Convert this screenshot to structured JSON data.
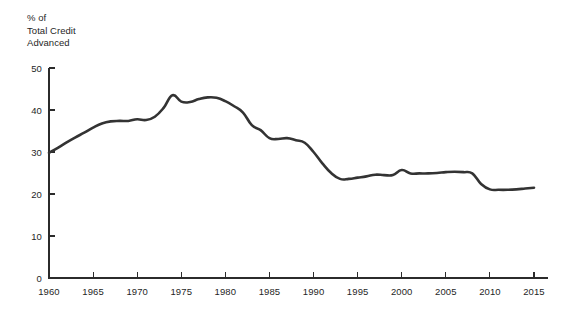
{
  "chart_data": {
    "type": "line",
    "title": "",
    "subtitle": "",
    "ylabel_lines": [
      "% of",
      "Total Credit",
      "Advanced"
    ],
    "ylabel": "% of Total Credit Advanced",
    "xlabel": "",
    "xlim": [
      1960,
      2015
    ],
    "ylim": [
      0,
      50
    ],
    "grid": false,
    "legend": false,
    "legend_position": "none",
    "line_color": "#333333",
    "axis_color": "#2b2b2b",
    "background_color": "#ffffff",
    "yticks": [
      0,
      10,
      20,
      30,
      40,
      50
    ],
    "ytick_labels": [
      "0",
      "10",
      "20",
      "30",
      "40",
      "50"
    ],
    "xticks": [
      1960,
      1965,
      1970,
      1975,
      1980,
      1985,
      1990,
      1995,
      2000,
      2005,
      2010,
      2015
    ],
    "xtick_labels": [
      "1960",
      "1965",
      "1970",
      "1975",
      "1980",
      "1985",
      "1990",
      "1995",
      "2000",
      "2005",
      "2010",
      "2015"
    ],
    "series": [
      {
        "name": "Share of total credit advanced",
        "color": "#333333",
        "x": [
          1960,
          1961,
          1962,
          1963,
          1964,
          1965,
          1966,
          1967,
          1968,
          1969,
          1970,
          1971,
          1972,
          1973,
          1974,
          1975,
          1976,
          1977,
          1978,
          1979,
          1980,
          1981,
          1982,
          1983,
          1984,
          1985,
          1986,
          1987,
          1988,
          1989,
          1990,
          1991,
          1992,
          1993,
          1994,
          1995,
          1996,
          1997,
          1998,
          1999,
          2000,
          2001,
          2002,
          2003,
          2004,
          2005,
          2006,
          2007,
          2008,
          2009,
          2010,
          2011,
          2012,
          2013,
          2014,
          2015
        ],
        "values": [
          29.8,
          31.0,
          32.3,
          33.5,
          34.6,
          35.8,
          36.8,
          37.3,
          37.4,
          37.4,
          37.8,
          37.6,
          38.4,
          40.5,
          43.5,
          42.0,
          41.9,
          42.6,
          43.0,
          42.9,
          42.1,
          40.9,
          39.4,
          36.4,
          35.2,
          33.3,
          33.1,
          33.3,
          32.8,
          32.2,
          30.0,
          27.3,
          25.0,
          23.6,
          23.6,
          23.9,
          24.2,
          24.6,
          24.5,
          24.5,
          25.7,
          24.9,
          24.9,
          24.9,
          25.0,
          25.2,
          25.3,
          25.2,
          24.9,
          22.4,
          21.1,
          21.0,
          21.0,
          21.1,
          21.3,
          21.5
        ]
      }
    ]
  },
  "axes_geometry": {
    "x_left_px": 49,
    "x_right_px": 534,
    "y_bottom_px": 278,
    "y_top_px": 68
  }
}
